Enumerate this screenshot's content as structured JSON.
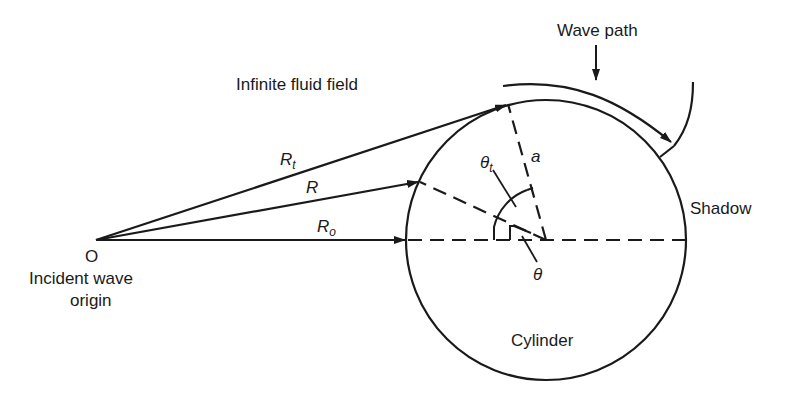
{
  "diagram": {
    "labels": {
      "wave_path": "Wave path",
      "fluid_field": "Infinite fluid field",
      "shadow": "Shadow",
      "cylinder": "Cylinder",
      "origin_point": "O",
      "origin_line1": "Incident wave",
      "origin_line2": "origin",
      "radius": "a",
      "rt_main": "R",
      "rt_sub": "t",
      "r_main": "R",
      "ro_main": "R",
      "ro_sub": "o",
      "theta_t_main": "θ",
      "theta_t_sub": "t",
      "theta": "θ"
    },
    "colors": {
      "stroke": "#1a1a1a",
      "background": "#ffffff"
    },
    "geometry": {
      "origin": [
        96,
        240
      ],
      "cylinder_center": [
        546,
        240
      ],
      "cylinder_radius": 140
    }
  }
}
